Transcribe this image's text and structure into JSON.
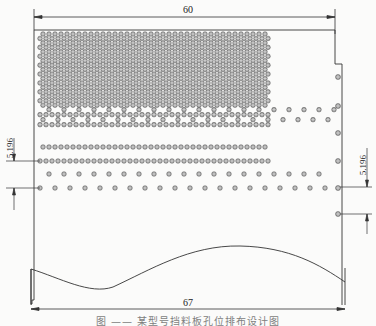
{
  "diagram": {
    "type": "perforated-plate-hole-layout",
    "dimensions": {
      "top_width": "60",
      "bottom_width": "67",
      "left_row_pitch": "5.196",
      "right_row_pitch": "5.196"
    },
    "caption": "图 ——  某型号挡料板孔位排布设计图",
    "hole_layout": {
      "dense_region_rows": 17,
      "dense_columns": 39,
      "hole_pitch_x": 6.0,
      "dense_row_pitch_y": 4.45,
      "sparse_rows": 2,
      "edge_holes_right": 6
    },
    "colors": {
      "line": "#333333",
      "hole_fill": "#9a9a9a",
      "hole_stroke": "#555555",
      "background": "#fbfbfa"
    }
  }
}
